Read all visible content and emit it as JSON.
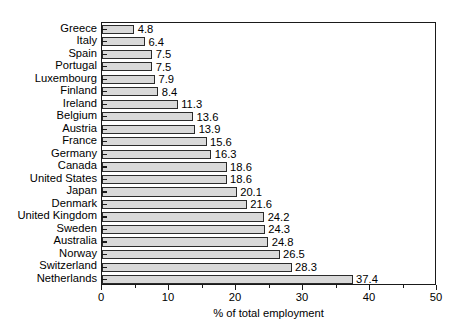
{
  "chart_data": {
    "type": "bar",
    "orientation": "horizontal",
    "title": "",
    "subtitle": "",
    "xlabel": "% of total employment",
    "ylabel": "",
    "xlim": [
      0,
      50
    ],
    "xticks": [
      0,
      10,
      20,
      30,
      40,
      50
    ],
    "xtick_labels": [
      "0",
      "10",
      "20",
      "30",
      "40",
      "50"
    ],
    "minor_tick_step": 5,
    "grid": false,
    "legend": null,
    "bar_color": "#d9d9d9",
    "bar_edge_color": "#2b2b2b",
    "axis_color": "#1a1a1a",
    "categories": [
      "Greece",
      "Italy",
      "Spain",
      "Portugal",
      "Luxembourg",
      "Finland",
      "Ireland",
      "Belgium",
      "Austria",
      "France",
      "Germany",
      "Canada",
      "United States",
      "Japan",
      "Denmark",
      "United Kingdom",
      "Sweden",
      "Australia",
      "Norway",
      "Switzerland",
      "Netherlands"
    ],
    "values": [
      4.8,
      6.4,
      7.5,
      7.5,
      7.9,
      8.4,
      11.3,
      13.6,
      13.9,
      15.6,
      16.3,
      18.6,
      18.6,
      20.1,
      21.6,
      24.2,
      24.3,
      24.8,
      26.5,
      28.3,
      37.4
    ],
    "value_labels": [
      "4.8",
      "6.4",
      "7.5",
      "7.5",
      "7.9",
      "8.4",
      "11.3",
      "13.6",
      "13.9",
      "15.6",
      "16.3",
      "18.6",
      "18.6",
      "20.1",
      "21.6",
      "24.2",
      "24.3",
      "24.8",
      "26.5",
      "28.3",
      "37.4"
    ]
  }
}
